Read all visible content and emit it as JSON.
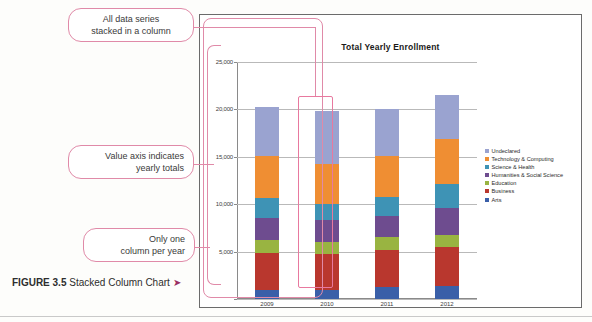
{
  "figure": {
    "caption_label": "FIGURE 3.5",
    "caption_text": " Stacked Column Chart ",
    "caption_arrow": "➤"
  },
  "callouts": [
    {
      "id": "series-stacked",
      "line1": "All data series",
      "line2": "stacked in a column"
    },
    {
      "id": "value-axis",
      "line1": "Value axis indicates",
      "line2": "yearly totals"
    },
    {
      "id": "one-column",
      "line1": "Only one",
      "line2": "column per year"
    }
  ],
  "colors": {
    "undeclared": "#9aa3d0",
    "technology": "#ef8e33",
    "science": "#3e93b5",
    "humanities": "#6e4c8f",
    "education": "#99b441",
    "business": "#b9372e",
    "arts": "#3a5fa8",
    "callout_pink": "#e08aa8",
    "highlight_pink": "#e8799f",
    "gridline": "#b9b9b9",
    "axis": "#8a8a8a"
  },
  "chart_data": {
    "type": "bar",
    "subtype": "stacked-column",
    "title": "Total Yearly Enrollment",
    "xlabel": "",
    "ylabel": "",
    "categories": [
      "2009",
      "2010",
      "2011",
      "2012"
    ],
    "ylim": [
      0,
      25000
    ],
    "yticks": [
      0,
      5000,
      10000,
      15000,
      20000,
      25000
    ],
    "ytick_labels": [
      "",
      "5,000",
      "10,000",
      "15,000",
      "20,000",
      "25,000"
    ],
    "grid": true,
    "legend_position": "right",
    "stack_order_bottom_to_top": [
      "Arts",
      "Business",
      "Education",
      "Humanities & Social Science",
      "Science & Health",
      "Technology & Computing",
      "Undeclared"
    ],
    "series": [
      {
        "name": "Undeclared",
        "color": "#9aa3d0",
        "values": [
          5200,
          5500,
          5000,
          4600
        ]
      },
      {
        "name": "Technology & Computing",
        "color": "#ef8e33",
        "values": [
          4400,
          4300,
          4300,
          4800
        ]
      },
      {
        "name": "Science & Health",
        "color": "#3e93b5",
        "values": [
          2100,
          1700,
          2000,
          2500
        ]
      },
      {
        "name": "Humanities & Social Science",
        "color": "#6e4c8f",
        "values": [
          2400,
          2300,
          2300,
          2800
        ]
      },
      {
        "name": "Education",
        "color": "#99b441",
        "values": [
          1300,
          1300,
          1300,
          1300
        ]
      },
      {
        "name": "Business",
        "color": "#b9372e",
        "values": [
          3900,
          3700,
          3900,
          4100
        ]
      },
      {
        "name": "Arts",
        "color": "#3a5fa8",
        "values": [
          1000,
          1000,
          1300,
          1400
        ]
      }
    ],
    "totals": [
      20300,
      19800,
      20100,
      21500
    ]
  }
}
